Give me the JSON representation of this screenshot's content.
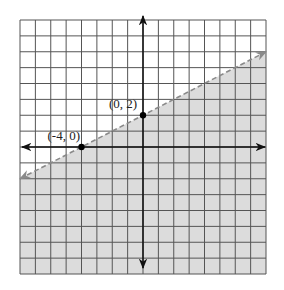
{
  "chart_data": {
    "type": "line",
    "title": "",
    "xlim": [
      -8,
      8
    ],
    "ylim": [
      -8,
      8
    ],
    "grid": true,
    "grid_step": 1,
    "boundary": {
      "style": "dashed",
      "slope": 0.5,
      "intercept": 2,
      "equation": "y = 0.5x + 2",
      "inequality": "y < 0.5x + 2",
      "shaded": "below"
    },
    "points": [
      {
        "x": -4,
        "y": 0,
        "label": "(-4, 0)"
      },
      {
        "x": 0,
        "y": 2,
        "label": "(0, 2)"
      }
    ]
  },
  "colors": {
    "shade": "#dcdcdc",
    "grid": "#555555",
    "axis": "#111111",
    "boundary": "#8a8a8a",
    "point": "#000000"
  }
}
